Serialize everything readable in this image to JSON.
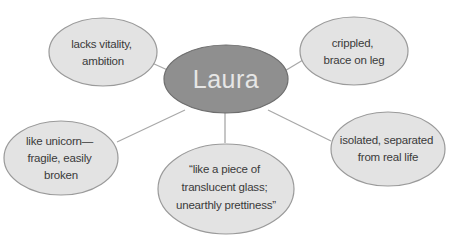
{
  "diagram": {
    "type": "concept-web",
    "colors": {
      "background": "#ffffff",
      "center_fill": "#8f8f8f",
      "center_stroke": "#6e6e6e",
      "center_text": "#e6e6e6",
      "bubble_fill": "#e3e3e3",
      "bubble_stroke": "#9a9a9a",
      "bubble_text": "#3a3a3a",
      "connector": "#a8a8a8"
    },
    "center": {
      "label": "Laura"
    },
    "nodes": [
      {
        "id": "top-left",
        "lines": [
          "lacks vitality,",
          "ambition"
        ]
      },
      {
        "id": "top-right",
        "lines": [
          "crippled,",
          "brace on leg"
        ]
      },
      {
        "id": "left",
        "lines": [
          "like unicorn—",
          "fragile, easily",
          "broken"
        ]
      },
      {
        "id": "right",
        "lines": [
          "isolated, separated",
          "from real life"
        ]
      },
      {
        "id": "bottom",
        "lines": [
          "“like a piece of",
          "translucent glass;",
          "unearthly prettiness”"
        ]
      }
    ]
  }
}
